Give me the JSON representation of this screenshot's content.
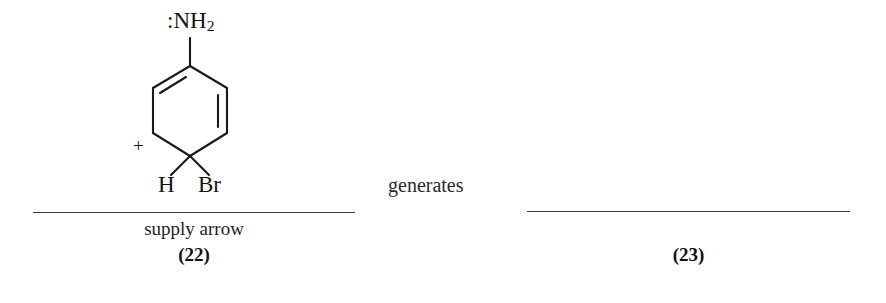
{
  "figure": {
    "background_color": "#ffffff",
    "ink_color": "#1a1a1a",
    "connector_word": "generates"
  },
  "left_structure": {
    "caption_name": "supply arrow",
    "caption_number": "(22)",
    "atoms": {
      "amine": ":NH",
      "amine_subscript": "2",
      "hydrogen": "H",
      "bromine": "Br",
      "charge": "+"
    },
    "description": "cyclohexadienyl cation bearing an amino group, a hydrogen and a bromine on the sp3 carbon"
  },
  "right_structure": {
    "caption_name": "",
    "caption_number": "(23)"
  }
}
